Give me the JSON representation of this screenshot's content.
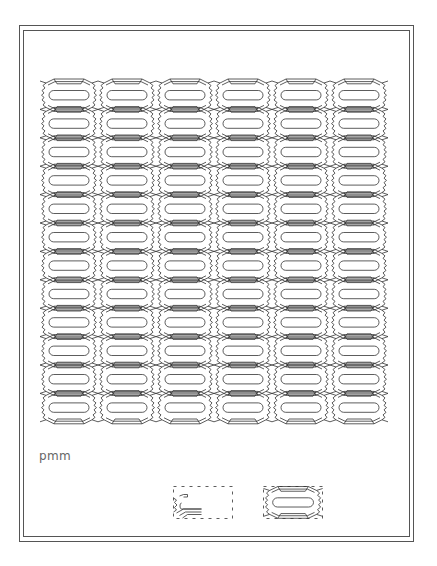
{
  "figure": {
    "group_label": "pmm",
    "pattern": {
      "columns": 6,
      "rows": 12,
      "origin_x": 40,
      "origin_y": 81,
      "cell_width": 58,
      "cell_height": 28.4,
      "stroke_color": "#333333",
      "background": "#ffffff"
    },
    "motifs": [
      {
        "name": "fundamental-region",
        "style": "dashed-box-with-partial-motif"
      },
      {
        "name": "unit-cell",
        "style": "dashed-box-with-full-motif"
      }
    ]
  }
}
